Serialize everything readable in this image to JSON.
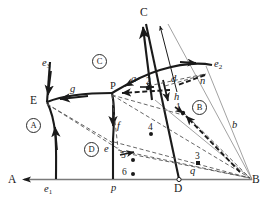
{
  "figure": {
    "type": "phase-diagram",
    "background_color": "#ffffff",
    "line_color": "#1a1a1a",
    "dashed_color": "#555555"
  },
  "corners": {
    "a": "A",
    "b": "B",
    "c": "C"
  },
  "region_labels": [
    {
      "id": "region-A",
      "text": "A",
      "x": 26,
      "y": 118
    },
    {
      "id": "region-C",
      "text": "C",
      "x": 92,
      "y": 54
    },
    {
      "id": "region-B",
      "text": "B",
      "x": 192,
      "y": 100
    },
    {
      "id": "region-D",
      "text": "D",
      "x": 84,
      "y": 142
    }
  ],
  "point_labels": [
    {
      "id": "label-e3",
      "text": "e",
      "sub": "3",
      "x": 42,
      "y": 58
    },
    {
      "id": "label-e2",
      "text": "e",
      "sub": "2",
      "x": 214,
      "y": 59
    },
    {
      "id": "label-e1",
      "text": "e",
      "sub": "1",
      "x": 44,
      "y": 186
    },
    {
      "id": "label-E",
      "text": "E",
      "x": 30,
      "y": 95
    },
    {
      "id": "label-g",
      "text": "g",
      "x": 70,
      "y": 88
    },
    {
      "id": "label-P",
      "text": "P",
      "x": 111,
      "y": 85
    },
    {
      "id": "label-a",
      "text": "a",
      "x": 131,
      "y": 76
    },
    {
      "id": "label-d",
      "text": "d",
      "x": 172,
      "y": 79
    },
    {
      "id": "label-n",
      "text": "n",
      "x": 200,
      "y": 80
    },
    {
      "id": "label-h",
      "text": "h",
      "x": 174,
      "y": 96
    },
    {
      "id": "label-b",
      "text": "b",
      "x": 232,
      "y": 124
    },
    {
      "id": "label-f",
      "text": "f",
      "x": 116,
      "y": 125
    },
    {
      "id": "label-e",
      "text": "e",
      "x": 110,
      "y": 147
    },
    {
      "id": "label-p",
      "text": "p",
      "x": 124,
      "y": 186
    },
    {
      "id": "label-q",
      "text": "q",
      "x": 196,
      "y": 170
    },
    {
      "id": "label-D-base",
      "text": "D",
      "x": 180,
      "y": 186
    }
  ],
  "numbered_points": [
    {
      "id": "point-1",
      "text": "1",
      "x": 178,
      "y": 110,
      "has_dot": true
    },
    {
      "id": "point-2",
      "text": "2",
      "x": 148,
      "y": 82,
      "has_dot": true
    },
    {
      "id": "point-3",
      "text": "3",
      "x": 192,
      "y": 157,
      "has_dot": true
    },
    {
      "id": "point-4",
      "text": "4",
      "x": 144,
      "y": 128,
      "has_dot": true
    },
    {
      "id": "point-5",
      "text": "5",
      "x": 126,
      "y": 155,
      "has_dot": true
    },
    {
      "id": "point-6",
      "text": "6",
      "x": 124,
      "y": 171,
      "has_dot": true
    }
  ]
}
